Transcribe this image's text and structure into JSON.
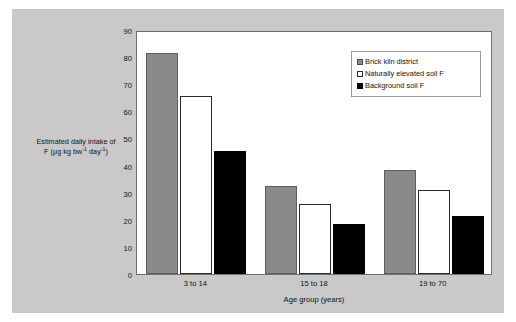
{
  "figure": {
    "background_color": "#ffffff",
    "panel_color": "#c9c9c9",
    "plot_color": "#ffffff"
  },
  "chart_data": {
    "type": "bar",
    "title": "",
    "categories": [
      "3 to 14",
      "15 to 18",
      "19 to 70"
    ],
    "series": [
      {
        "name": "Brick kiln district",
        "color": "#8a8a8a",
        "values": [
          81.5,
          32.5,
          38.5
        ]
      },
      {
        "name": "Naturally elevated soil F",
        "color": "#ffffff",
        "values": [
          65.5,
          26.0,
          31.0
        ]
      },
      {
        "name": "Background soil F",
        "color": "#000000",
        "values": [
          45.5,
          18.5,
          21.5
        ]
      }
    ],
    "xlabel": "Age group (years)",
    "ylabel_line1": "Estimated daily intake of",
    "ylabel_line2_pre": "F (µg kg bw",
    "ylabel_line2_sup1": "-1",
    "ylabel_line2_mid": " day",
    "ylabel_line2_sup2": "-1",
    "ylabel_line2_post": ")",
    "ylim": [
      0,
      90
    ],
    "yticks": [
      0,
      10,
      20,
      30,
      40,
      50,
      60,
      70,
      80,
      90
    ],
    "ytick_labels": [
      "0",
      "10",
      "20",
      "30",
      "40",
      "50",
      "60",
      "70",
      "80",
      "90"
    ],
    "grid": false,
    "legend_position": "top-right-inside"
  }
}
